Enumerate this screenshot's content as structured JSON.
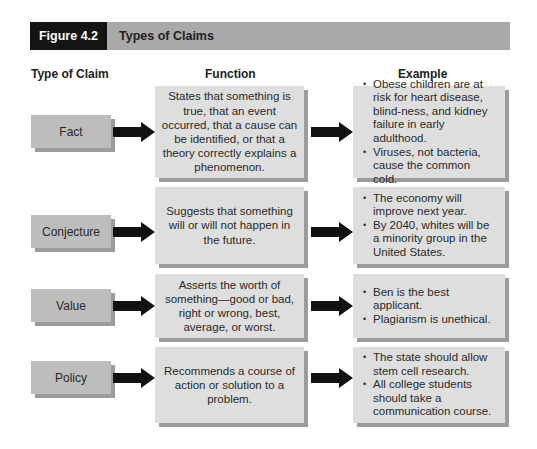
{
  "header": {
    "figure_number": "Figure 4.2",
    "title": "Types of Claims"
  },
  "columns": {
    "type": "Type of Claim",
    "function": "Function",
    "example": "Example"
  },
  "rows": [
    {
      "type": "Fact",
      "function": "States that something is true, that an event occurred, that a cause can be identified, or that a theory correctly explains a phenomenon.",
      "examples": [
        "Obese children are at risk for heart disease, blind-ness, and kidney failure in early adulthood.",
        "Viruses, not bacteria, cause the common cold."
      ]
    },
    {
      "type": "Conjecture",
      "function": "Suggests that something will or will not happen in the future.",
      "examples": [
        "The economy will improve next year.",
        "By 2040, whites will be a minority group in the United States."
      ]
    },
    {
      "type": "Value",
      "function": "Asserts the worth of something—good or bad, right or wrong, best, average, or worst.",
      "examples": [
        "Ben is the best applicant.",
        "Plagiarism is unethical."
      ]
    },
    {
      "type": "Policy",
      "function": "Recommends a course of action or solution to a problem.",
      "examples": [
        "The state should allow stem cell research.",
        "All college students should take a communication course."
      ]
    }
  ],
  "colors": {
    "header_dark": "#141414",
    "header_bar": "#a9a9a9",
    "label_box": "#bdbdbd",
    "content_box": "#dedede",
    "shadow": "#9c9c9c",
    "arrow": "#111111"
  }
}
